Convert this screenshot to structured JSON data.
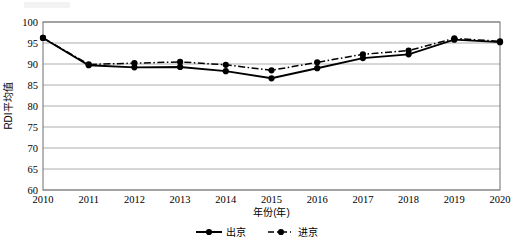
{
  "chart_data": {
    "type": "line",
    "title": "",
    "xlabel": "年份(年)",
    "ylabel": "RDI平均值",
    "categories": [
      "2010",
      "2011",
      "2012",
      "2013",
      "2014",
      "2015",
      "2016",
      "2017",
      "2018",
      "2019",
      "2020"
    ],
    "x": [
      2010,
      2011,
      2012,
      2013,
      2014,
      2015,
      2016,
      2017,
      2018,
      2019,
      2020
    ],
    "series": [
      {
        "name": "出京",
        "style": "solid",
        "marker": "filled-circle",
        "values": [
          96.2,
          89.7,
          89.2,
          89.3,
          88.3,
          86.6,
          89.0,
          91.4,
          92.3,
          95.8,
          95.2
        ]
      },
      {
        "name": "进京",
        "style": "dashed",
        "marker": "filled-circle",
        "values": [
          96.2,
          89.9,
          90.2,
          90.5,
          89.8,
          88.5,
          90.4,
          92.3,
          93.2,
          96.1,
          95.4
        ]
      }
    ],
    "ylim": [
      60,
      100
    ],
    "yticks": [
      60,
      65,
      70,
      75,
      80,
      85,
      90,
      95,
      100
    ],
    "ytick_labels": [
      "60",
      "65",
      "70",
      "75",
      "80",
      "85",
      "90",
      "95",
      "100"
    ],
    "xlim": [
      2010,
      2020
    ],
    "grid": "horizontal",
    "legend_position": "bottom",
    "colors": {
      "series": "#000000",
      "grid": "#9a9a9a",
      "frame": "#6e6e6e",
      "background": "#ffffff"
    }
  },
  "legend": {
    "items": [
      {
        "label": "出京",
        "icon": "solid-line-marker-icon"
      },
      {
        "label": "进京",
        "icon": "dashed-line-marker-icon"
      }
    ]
  }
}
